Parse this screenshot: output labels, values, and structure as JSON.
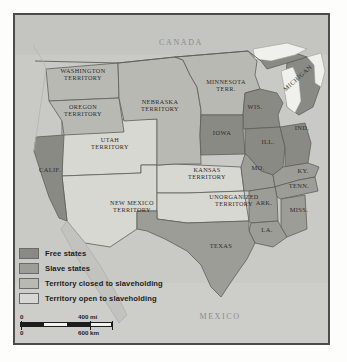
{
  "map": {
    "title_countries": {
      "canada": "CANADA",
      "mexico": "MEXICO"
    },
    "territories": [
      {
        "name": "WASHINGTON\nTERRITORY",
        "category": "closed"
      },
      {
        "name": "OREGON\nTERRITORY",
        "category": "closed"
      },
      {
        "name": "NEBRASKA\nTERRITORY",
        "category": "closed"
      },
      {
        "name": "MINNESOTA\nTERR.",
        "category": "closed"
      },
      {
        "name": "UTAH\nTERRITORY",
        "category": "open"
      },
      {
        "name": "KANSAS\nTERRITORY",
        "category": "open"
      },
      {
        "name": "NEW MEXICO\nTERRITORY",
        "category": "open"
      },
      {
        "name": "UNORGANIZED\nTERRITORY",
        "category": "open"
      }
    ],
    "states": [
      {
        "name": "CALIF.",
        "category": "free"
      },
      {
        "name": "WIS.",
        "category": "free"
      },
      {
        "name": "IOWA",
        "category": "free"
      },
      {
        "name": "MICHIGAN",
        "category": "free"
      },
      {
        "name": "ILL.",
        "category": "free"
      },
      {
        "name": "IND.",
        "category": "free"
      },
      {
        "name": "MO.",
        "category": "slave"
      },
      {
        "name": "KY.",
        "category": "slave"
      },
      {
        "name": "TENN.",
        "category": "slave"
      },
      {
        "name": "ARK.",
        "category": "slave"
      },
      {
        "name": "MISS.",
        "category": "slave"
      },
      {
        "name": "LA.",
        "category": "slave"
      },
      {
        "name": "TEXAS",
        "category": "slave"
      }
    ]
  },
  "legend": {
    "items": [
      {
        "label": "Free states",
        "color": "#8a8a85"
      },
      {
        "label": "Slave states",
        "color": "#9d9d98"
      },
      {
        "label": "Territory closed to slaveholding",
        "color": "#b9b9b4"
      },
      {
        "label": "Territory open to slaveholding",
        "color": "#d8d8d3"
      }
    ]
  },
  "scale": {
    "miles_zero": "0",
    "miles_max": "400 mi",
    "km_zero": "0",
    "km_max": "600 km"
  },
  "colors": {
    "free": "#8a8a85",
    "slave": "#9d9d98",
    "closed": "#b9b9b4",
    "open": "#d8d8d3",
    "water": "#c9c9c5",
    "lake": "#f0f0ec",
    "frame": "#4c4c4c",
    "border": "#5e5e5a"
  }
}
